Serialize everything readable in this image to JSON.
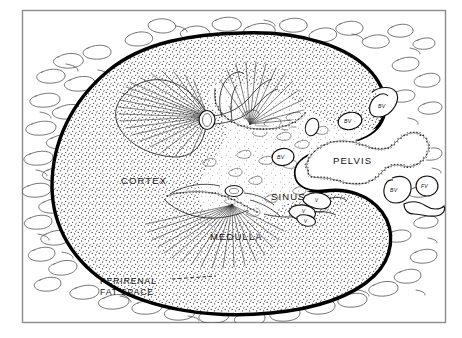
{
  "figure": {
    "kind": "anatomical-diagram",
    "background_color": "#ffffff",
    "ink_color": "#111111",
    "frame_color": "#808080"
  },
  "labels": {
    "cortex": "CORTEX",
    "medulla": "MEDULLA",
    "sinus": "SINUS",
    "pelvis": "PELVIS",
    "perirenal_line1": "PERIRENAL",
    "perirenal_line2": "FAT SPACE"
  },
  "vessel_labels": [
    {
      "id": "bv-sinus",
      "text": "BV"
    },
    {
      "id": "bv-upper-inner",
      "text": "BV"
    },
    {
      "id": "bv-upper-outer",
      "text": "BV"
    },
    {
      "id": "bv-lower-right",
      "text": "BV"
    },
    {
      "id": "fv-lower-right",
      "text": "FV"
    }
  ],
  "vein_labels": [
    {
      "id": "v-upper-calyx",
      "text": "V"
    },
    {
      "id": "v-sinus-upper",
      "text": "V"
    },
    {
      "id": "v-sinus-lower",
      "text": "V"
    },
    {
      "id": "v-sinus-left",
      "text": "V"
    }
  ]
}
